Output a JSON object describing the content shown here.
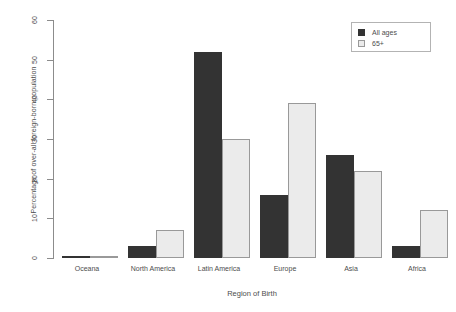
{
  "chart_data": {
    "type": "bar",
    "title": "",
    "xlabel": "Region of Birth",
    "ylabel": "Percentage of over-all foreign-born population",
    "categories": [
      "Oceana",
      "North America",
      "Latin America",
      "Europe",
      "Asia",
      "Africa"
    ],
    "series": [
      {
        "name": "All ages",
        "color": "#333333",
        "values": [
          0.4,
          3,
          52,
          16,
          26,
          3
        ]
      },
      {
        "name": "65+",
        "color": "#ebebeb",
        "values": [
          0.3,
          7,
          30,
          39,
          22,
          12
        ]
      }
    ],
    "ylim": [
      0,
      60
    ],
    "yticks": [
      0,
      10,
      20,
      30,
      40,
      50,
      60
    ],
    "ytick_labels": [
      "0",
      "10",
      "20",
      "30",
      "40",
      "50",
      "60"
    ],
    "grid": false,
    "legend_position": "top-right",
    "legend_entries": [
      "All ages",
      "65+"
    ]
  },
  "legend": {
    "entries": [
      {
        "label": "All ages",
        "swatch": "dark-square-icon"
      },
      {
        "label": "65+",
        "swatch": "light-square-icon"
      }
    ]
  },
  "axes": {
    "y_title": "Percentage of over-all foreign-born population",
    "x_title": "Region of Birth"
  }
}
